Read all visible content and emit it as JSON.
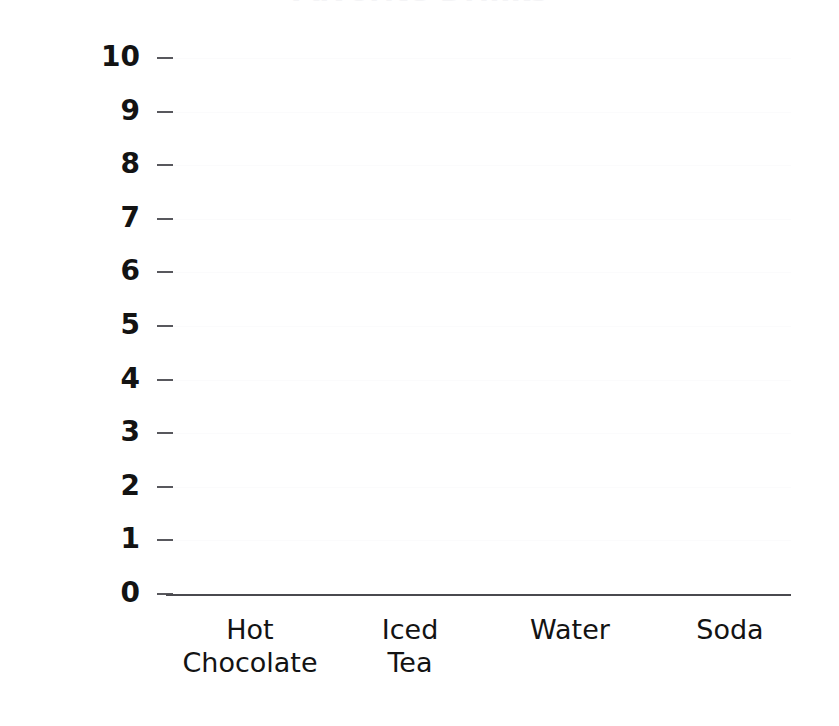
{
  "chart_data": {
    "type": "bar",
    "title": "",
    "title_clipped_remnant": "Favorite Drinks",
    "xlabel": "",
    "ylabel": "Number of Students",
    "categories": [
      "Hot Chocolate",
      "Iced Tea",
      "Water",
      "Soda"
    ],
    "category_lines": [
      [
        "Hot",
        "Chocolate"
      ],
      [
        "Iced",
        "Tea"
      ],
      [
        "Water",
        ""
      ],
      [
        "Soda",
        ""
      ]
    ],
    "values": [
      null,
      null,
      null,
      null
    ],
    "ylim": [
      0,
      10
    ],
    "yticks": [
      10,
      9,
      8,
      7,
      6,
      5,
      4,
      3,
      2,
      1,
      0
    ],
    "ytick_labels": [
      "10",
      "9",
      "8",
      "7",
      "6",
      "5",
      "4",
      "3",
      "2",
      "1",
      "0"
    ],
    "grid": true,
    "grid_color": "#fbfbfc",
    "legend": false,
    "legend_position": "none",
    "axis_color": "#4a4a4f",
    "tick_color": "#58585d",
    "text_color": "#131313",
    "background": "#ffffff",
    "note": "Blank bar chart template - no bars plotted; plot area is empty for students to fill in."
  },
  "axes": {
    "y_title": "Number of Students",
    "x_category_centers_px": [
      250,
      410,
      570,
      730
    ],
    "baseline_y_px": 594,
    "plot_left_px": 166,
    "plot_right_px": 791,
    "plot_top_px": 58
  }
}
